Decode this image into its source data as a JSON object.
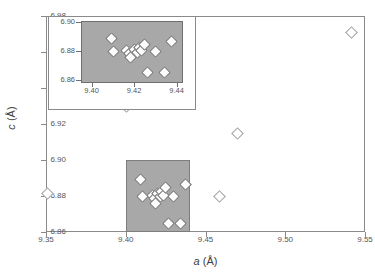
{
  "chart_data": {
    "type": "scatter",
    "title": "",
    "xlabel": "a (Å)",
    "ylabel": "c (Å)",
    "xlim": [
      9.35,
      9.55
    ],
    "ylim": [
      6.86,
      6.98
    ],
    "xticks": [
      "9.35",
      "9.40",
      "9.45",
      "9.50",
      "9.55"
    ],
    "yticks": [
      "6.86",
      "6.88",
      "6.90",
      "6.92",
      "6.94",
      "6.96",
      "6.98"
    ],
    "xtick_values": [
      9.35,
      9.4,
      9.45,
      9.5,
      9.55
    ],
    "ytick_values": [
      6.86,
      6.88,
      6.9,
      6.92,
      6.94,
      6.96,
      6.98
    ],
    "grid": false,
    "legend": null,
    "marker": "open-diamond",
    "highlight_region": {
      "label": "shaded zoom region",
      "x_range": [
        9.4,
        9.44
      ],
      "y_range": [
        6.86,
        6.9
      ],
      "fill_color": "#a8a8a8"
    },
    "points": [
      {
        "x": 9.351,
        "y": 6.8815
      },
      {
        "x": 9.4005,
        "y": 6.93
      },
      {
        "x": 9.4095,
        "y": 6.889
      },
      {
        "x": 9.4105,
        "y": 6.88
      },
      {
        "x": 9.4165,
        "y": 6.8805
      },
      {
        "x": 9.418,
        "y": 6.8785
      },
      {
        "x": 9.4185,
        "y": 6.876
      },
      {
        "x": 9.42,
        "y": 6.8815
      },
      {
        "x": 9.4215,
        "y": 6.8795
      },
      {
        "x": 9.4225,
        "y": 6.8825
      },
      {
        "x": 9.4235,
        "y": 6.8805
      },
      {
        "x": 9.425,
        "y": 6.8845
      },
      {
        "x": 9.4265,
        "y": 6.865
      },
      {
        "x": 9.43,
        "y": 6.88
      },
      {
        "x": 9.4345,
        "y": 6.865
      },
      {
        "x": 9.4375,
        "y": 6.8865
      },
      {
        "x": 9.459,
        "y": 6.88
      },
      {
        "x": 9.47,
        "y": 6.915
      },
      {
        "x": 9.5415,
        "y": 6.971
      }
    ],
    "inset": {
      "xlabel": "",
      "ylabel": "",
      "xlim": [
        9.395,
        9.443
      ],
      "ylim": [
        6.858,
        6.901
      ],
      "xticks": [
        "9.40",
        "9.42",
        "9.44"
      ],
      "ytick s": [
        "6.86",
        "6.88",
        "6.90"
      ],
      "yticks": [
        "6.86",
        "6.88",
        "6.90"
      ],
      "xtick_values": [
        9.4,
        9.42,
        9.44
      ],
      "ytick_values": [
        6.86,
        6.88,
        6.9
      ],
      "fill_color": "#a8a8a8",
      "marker": "filled-diamond",
      "points": [
        {
          "x": 9.4095,
          "y": 6.889
        },
        {
          "x": 9.4105,
          "y": 6.88
        },
        {
          "x": 9.4165,
          "y": 6.8805
        },
        {
          "x": 9.418,
          "y": 6.8785
        },
        {
          "x": 9.4185,
          "y": 6.876
        },
        {
          "x": 9.42,
          "y": 6.8815
        },
        {
          "x": 9.4215,
          "y": 6.8795
        },
        {
          "x": 9.4225,
          "y": 6.8825
        },
        {
          "x": 9.4235,
          "y": 6.8805
        },
        {
          "x": 9.425,
          "y": 6.8845
        },
        {
          "x": 9.4265,
          "y": 6.865
        },
        {
          "x": 9.43,
          "y": 6.88
        },
        {
          "x": 9.4345,
          "y": 6.865
        },
        {
          "x": 9.4375,
          "y": 6.8865
        }
      ]
    }
  }
}
